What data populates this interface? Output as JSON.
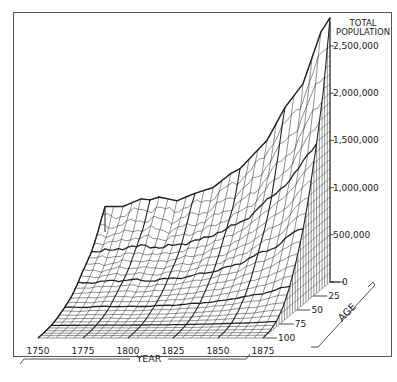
{
  "chart_data": {
    "type": "surface",
    "title": "",
    "zlabel": "TOTAL POPULATION",
    "xlabel": "YEAR",
    "ylabel": "AGE",
    "x_ticks": [
      "1750",
      "1775",
      "1800",
      "1825",
      "1850",
      "1875"
    ],
    "y_ticks": [
      "0",
      "25",
      "50",
      "75",
      "100"
    ],
    "z_ticks": [
      "0",
      "500,000",
      "1,000,000",
      "1,500,000",
      "2,000,000",
      "2,500,000"
    ],
    "x_range": [
      1750,
      1875
    ],
    "y_range": [
      0,
      100
    ],
    "z_range": [
      0,
      2800000
    ],
    "grid": true,
    "style": "wireframe stereogram, black ink on white",
    "years": [
      1750,
      1760,
      1770,
      1775,
      1780,
      1790,
      1800,
      1810,
      1820,
      1825,
      1830,
      1840,
      1850,
      1860,
      1870,
      1875
    ],
    "total_population_age0": [
      800000,
      800000,
      880000,
      870000,
      900000,
      860000,
      940000,
      1000000,
      1150000,
      1200000,
      1300000,
      1500000,
      1850000,
      2100000,
      2650000,
      2800000
    ],
    "cumulative_age_levels": [
      0,
      10,
      20,
      30,
      40,
      50,
      60,
      70,
      80,
      90,
      100
    ],
    "cumulative_share_by_age": [
      1.0,
      0.75,
      0.56,
      0.41,
      0.29,
      0.19,
      0.11,
      0.055,
      0.02,
      0.005,
      0.0
    ]
  },
  "labels": {
    "z_title_1": "TOTAL",
    "z_title_2": "POPULATION",
    "x_title": "YEAR",
    "y_title": "AGE"
  }
}
